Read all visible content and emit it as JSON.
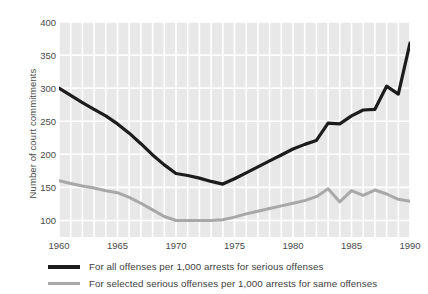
{
  "chart_data": {
    "type": "line",
    "title": "",
    "xlabel": "",
    "ylabel": "Number of court commitments",
    "xlim": [
      1960,
      1990
    ],
    "ylim": [
      75,
      400
    ],
    "grid": true,
    "grid_color": "#ffffff",
    "plot_background": "#e8e8e8",
    "legend_position": "below",
    "x_ticks": [
      1960,
      1965,
      1970,
      1975,
      1980,
      1985,
      1990
    ],
    "x_tick_labels": [
      "1960",
      "1965",
      "1970",
      "1975",
      "1980",
      "1985",
      "1990"
    ],
    "y_ticks": [
      100,
      150,
      200,
      250,
      300,
      350,
      400
    ],
    "y_tick_labels": [
      "100",
      "150",
      "200",
      "250",
      "300",
      "350",
      "400"
    ],
    "x": [
      1960,
      1961,
      1962,
      1963,
      1964,
      1965,
      1966,
      1967,
      1968,
      1969,
      1970,
      1971,
      1972,
      1973,
      1974,
      1975,
      1976,
      1977,
      1978,
      1979,
      1980,
      1981,
      1982,
      1983,
      1984,
      1985,
      1986,
      1987,
      1988,
      1989,
      1990
    ],
    "series": [
      {
        "name": "For all offenses per 1,000 arrests for serious offenses",
        "color": "#1c1c1c",
        "width": 3.2,
        "values": [
          300,
          289,
          278,
          268,
          258,
          246,
          232,
          216,
          199,
          184,
          171,
          168,
          164,
          159,
          155,
          163,
          172,
          181,
          190,
          199,
          208,
          215,
          221,
          247,
          246,
          258,
          267,
          268,
          303,
          291,
          368
        ]
      },
      {
        "name": "For selected serious offenses per 1,000 arrests for same offenses",
        "color": "#a8a8a8",
        "width": 3.0,
        "values": [
          160,
          156,
          152,
          149,
          145,
          142,
          135,
          126,
          116,
          106,
          100,
          100,
          100,
          100,
          101,
          105,
          110,
          114,
          118,
          122,
          126,
          130,
          136,
          148,
          128,
          145,
          138,
          146,
          140,
          132,
          129
        ]
      }
    ]
  },
  "axes": {
    "y_label": "Number of court commitments"
  },
  "legend": {
    "items": [
      {
        "label": "For all offenses per 1,000 arrests for serious offenses",
        "swatch": "black"
      },
      {
        "label": "For selected serious offenses per 1,000 arrests for same offenses",
        "swatch": "gray"
      }
    ]
  }
}
